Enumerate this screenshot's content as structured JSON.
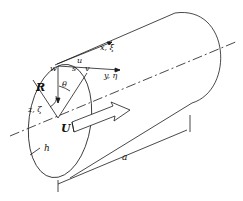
{
  "diagram": {
    "type": "cylindrical shell coordinate diagram",
    "labels": {
      "x_axis": "x, ξ",
      "y_axis": "y, η",
      "z_axis": "z, ζ",
      "u": "u",
      "v": "v",
      "w": "w",
      "s": "s",
      "theta": "θ",
      "radius": "R",
      "thickness": "h",
      "flow_velocity": "U",
      "length": "a"
    },
    "colors": {
      "stroke": "#1a1a1a",
      "background": "#ffffff"
    }
  }
}
